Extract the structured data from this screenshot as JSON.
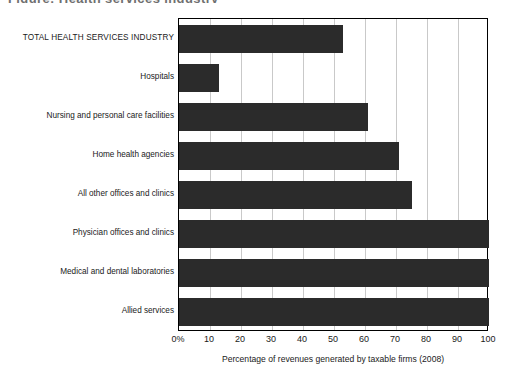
{
  "figure": {
    "title_remnant": "Figure: Health services industry",
    "x_caption": "Percentage of revenues generated by taxable firms (2008)"
  },
  "axis": {
    "tick_labels": [
      "0%",
      "10",
      "20",
      "30",
      "40",
      "50",
      "60",
      "70",
      "80",
      "90",
      "100"
    ],
    "tick_values": [
      0,
      10,
      20,
      30,
      40,
      50,
      60,
      70,
      80,
      90,
      100
    ]
  },
  "style": {
    "bar_color": "#2b2b2b",
    "gridline_color": "#c9c9c9",
    "frame_color": "#000000",
    "background": "#ffffff"
  },
  "chart_data": {
    "type": "bar",
    "orientation": "horizontal",
    "title": "",
    "xlabel": "Percentage of revenues generated by taxable firms (2008)",
    "ylabel": "",
    "xlim": [
      0,
      100
    ],
    "xticks": [
      0,
      10,
      20,
      30,
      40,
      50,
      60,
      70,
      80,
      90,
      100
    ],
    "xtick_labels": [
      "0%",
      "10",
      "20",
      "30",
      "40",
      "50",
      "60",
      "70",
      "80",
      "90",
      "100"
    ],
    "grid": "vertical",
    "legend": "none",
    "categories": [
      "TOTAL HEALTH SERVICES INDUSTRY",
      "Hospitals",
      "Nursing and personal care facilities",
      "Home health agencies",
      "All other offices and clinics",
      "Physician offices and clinics",
      "Medical and dental laboratories",
      "Allied services"
    ],
    "values": [
      53,
      13,
      61,
      71,
      75,
      100,
      100,
      100
    ]
  }
}
